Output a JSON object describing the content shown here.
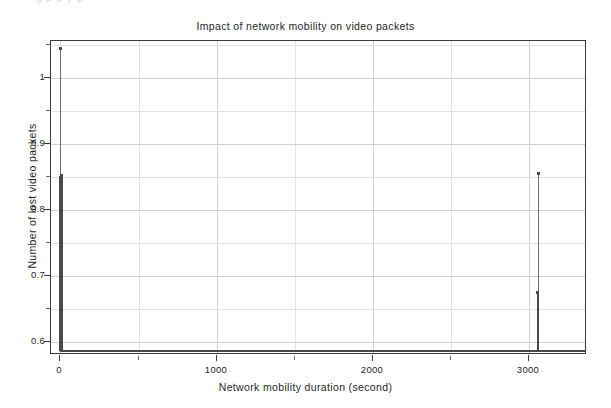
{
  "cropped_header_text": "g      p   p              y                              p",
  "chart_data": {
    "type": "line",
    "title": "Impact of network mobility on video packets",
    "xlabel": "Network mobility duration (second)",
    "ylabel": "Number of lost video packets",
    "xlim": [
      -60,
      3370
    ],
    "ylim": [
      0.5805,
      1.0555
    ],
    "grid": true,
    "legend": null,
    "x_ticks": [
      0,
      1000,
      2000,
      3000
    ],
    "x_tick_labels": [
      "0",
      "1000",
      "2000",
      "3000"
    ],
    "x_minor_ticks": [
      500,
      1500,
      2500,
      3500
    ],
    "y_ticks": [
      0.6,
      0.7,
      0.8,
      0.9,
      1.0
    ],
    "y_tick_labels": [
      "0.6",
      "0.7",
      "0.8",
      "0.9",
      "1"
    ],
    "y_minor_ticks": [
      0.65,
      0.75,
      0.85,
      0.95,
      1.05
    ],
    "series": [
      {
        "name": "lost video packets",
        "baseline_value": 0.5875,
        "points": [
          {
            "x": 0,
            "y": 1.044
          },
          {
            "x": 8,
            "y": 0.852
          },
          {
            "x": 20,
            "y": 0.5875
          },
          {
            "x": 1000,
            "y": 0.5875
          },
          {
            "x": 2000,
            "y": 0.5875
          },
          {
            "x": 3040,
            "y": 0.675
          },
          {
            "x": 3060,
            "y": 0.855
          },
          {
            "x": 3080,
            "y": 0.5875
          },
          {
            "x": 3350,
            "y": 0.5875
          }
        ],
        "spikes": [
          {
            "x": 0,
            "peak": 1.044,
            "base": 0.5875,
            "weight": "thin"
          },
          {
            "x": 8,
            "peak": 0.852,
            "base": 0.5875,
            "weight": "thick"
          },
          {
            "x": 3060,
            "peak": 0.855,
            "base": 0.5875,
            "weight": "thin"
          },
          {
            "x": 3055,
            "peak": 0.675,
            "base": 0.5875,
            "weight": "thick"
          }
        ]
      }
    ]
  },
  "colors": {
    "series": "#4a4a4a",
    "frame": "#3a3a3a",
    "grid": "#e2e2e2",
    "background": "#ffffff",
    "text": "#1f1f1f"
  }
}
